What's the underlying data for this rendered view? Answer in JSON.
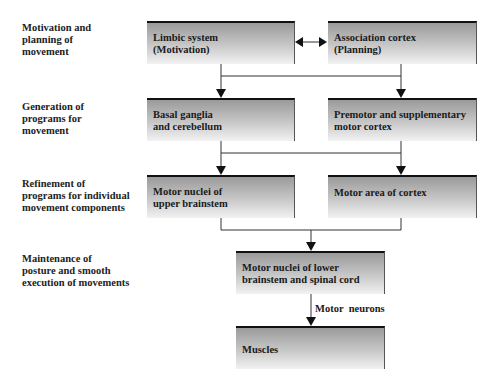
{
  "diagram": {
    "levels": [
      {
        "label_lines": [
          "Motivation and",
          "planning of",
          "movement"
        ]
      },
      {
        "label_lines": [
          "Generation of",
          "programs for",
          "movement"
        ]
      },
      {
        "label_lines": [
          "Refinement of",
          "programs for individual",
          "movement components"
        ]
      },
      {
        "label_lines": [
          "Maintenance of",
          "posture and smooth",
          "execution of movements"
        ]
      }
    ],
    "nodes": {
      "limbic": {
        "lines": [
          "Limbic system",
          "(Motivation)"
        ]
      },
      "association": {
        "lines": [
          "Association cortex",
          "(Planning)"
        ]
      },
      "basal": {
        "lines": [
          "Basal ganglia",
          "and cerebellum"
        ]
      },
      "premotor": {
        "lines": [
          "Premotor and supplementary",
          "motor cortex"
        ]
      },
      "upper_brainstem": {
        "lines": [
          "Motor nuclei of",
          "upper brainstem"
        ]
      },
      "motor_area": {
        "lines": [
          "Motor area of cortex"
        ]
      },
      "lower_brainstem": {
        "lines": [
          "Motor nuclei of lower",
          "brainstem and spinal cord"
        ]
      },
      "muscles": {
        "lines": [
          "Muscles"
        ]
      }
    },
    "edges": [
      {
        "from": "limbic",
        "to": "association",
        "type": "bidirectional"
      },
      {
        "from": [
          "limbic",
          "association"
        ],
        "to": "basal"
      },
      {
        "from": [
          "limbic",
          "association"
        ],
        "to": "premotor"
      },
      {
        "from": [
          "basal",
          "premotor"
        ],
        "to": "upper_brainstem"
      },
      {
        "from": [
          "basal",
          "premotor"
        ],
        "to": "motor_area"
      },
      {
        "from": [
          "upper_brainstem",
          "motor_area"
        ],
        "to": "lower_brainstem"
      },
      {
        "from": "lower_brainstem",
        "to": "muscles",
        "label": "Motor  neurons"
      }
    ],
    "colors": {
      "box_top": "#9a9a9a",
      "box_bottom": "#f2f2f2",
      "border": "#111111",
      "line": "#333333"
    }
  }
}
